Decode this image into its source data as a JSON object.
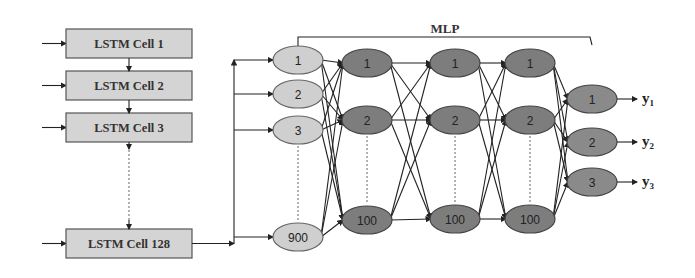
{
  "diagram": {
    "lstm_cells": [
      {
        "label": "LSTM Cell 1",
        "y": 29
      },
      {
        "label": "LSTM Cell 2",
        "y": 71
      },
      {
        "label": "LSTM Cell 3",
        "y": 113
      },
      {
        "label": "LSTM Cell 128",
        "y": 229
      }
    ],
    "mlp_label": "MLP",
    "input_layer": {
      "x": 298,
      "nodes": [
        {
          "label": "1",
          "y": 60
        },
        {
          "label": "2",
          "y": 94
        },
        {
          "label": "3",
          "y": 130
        },
        {
          "label": "900",
          "y": 237
        }
      ]
    },
    "hidden_layers": [
      {
        "x": 367,
        "nodes": [
          {
            "label": "1",
            "y": 63
          },
          {
            "label": "2",
            "y": 120
          },
          {
            "label": "100",
            "y": 220
          }
        ]
      },
      {
        "x": 455,
        "nodes": [
          {
            "label": "1",
            "y": 63
          },
          {
            "label": "2",
            "y": 120
          },
          {
            "label": "100",
            "y": 219
          }
        ]
      },
      {
        "x": 530,
        "nodes": [
          {
            "label": "1",
            "y": 63
          },
          {
            "label": "2",
            "y": 120
          },
          {
            "label": "100",
            "y": 219
          }
        ]
      }
    ],
    "output_layer": {
      "x": 592,
      "nodes": [
        {
          "label": "1",
          "y": 99,
          "output": "y",
          "sub": "1"
        },
        {
          "label": "2",
          "y": 142,
          "output": "y",
          "sub": "2"
        },
        {
          "label": "3",
          "y": 182,
          "output": "y",
          "sub": "3"
        }
      ]
    },
    "colors": {
      "lstm_fill": "#d4d4d4",
      "input_node_fill": "#cfcfcf",
      "hidden_node_fill": "#7d7d7d",
      "output_node_fill": "#8a8a8a"
    }
  }
}
